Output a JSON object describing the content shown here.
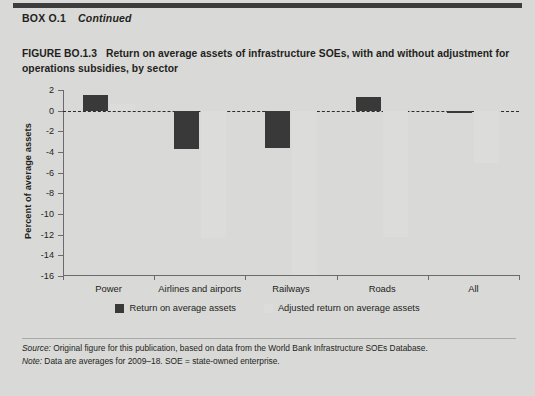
{
  "box": {
    "label": "BOX O.1",
    "continued": "Continued"
  },
  "figure": {
    "label": "FIGURE BO.1.3",
    "title": "Return on average assets of infrastructure SOEs, with and without adjustment for operations subsidies, by sector"
  },
  "legend": {
    "position": "bottom-center",
    "items": [
      {
        "label": "Return on average assets",
        "color": "#393939"
      },
      {
        "label": "Adjusted return on average assets",
        "color": "#dcdcda"
      }
    ]
  },
  "notes": {
    "source_label": "Source:",
    "source_text": "Original figure for this publication, based on data from the World Bank Infrastructure SOEs Database.",
    "note_label": "Note:",
    "note_text": "Data are averages for 2009–18. SOE = state-owned enterprise."
  },
  "chart_data": {
    "type": "bar",
    "title": "Return on average assets of infrastructure SOEs, with and without adjustment for operations subsidies, by sector",
    "xlabel": "",
    "ylabel": "Percent of average assets",
    "categories": [
      "Power",
      "Airlines and airports",
      "Railways",
      "Roads",
      "All"
    ],
    "series": [
      {
        "name": "Return on average assets",
        "color": "#393939",
        "values": [
          1.5,
          -3.7,
          -3.6,
          1.3,
          -0.2
        ]
      },
      {
        "name": "Adjusted return on average assets",
        "color": "#dcdcda",
        "values": [
          0.6,
          -12.3,
          -15.9,
          -12.2,
          -5.1
        ]
      }
    ],
    "ylim": [
      -16,
      2
    ],
    "yticks": [
      2,
      0,
      -2,
      -4,
      -6,
      -8,
      -10,
      -12,
      -14,
      -16
    ],
    "ytick_labels": [
      "2",
      "0",
      "-2",
      "-4",
      "-6",
      "-8",
      "-10",
      "-12",
      "-14",
      "-16"
    ],
    "grid": false,
    "zero_line": true,
    "zero_line_style": "dashed"
  }
}
